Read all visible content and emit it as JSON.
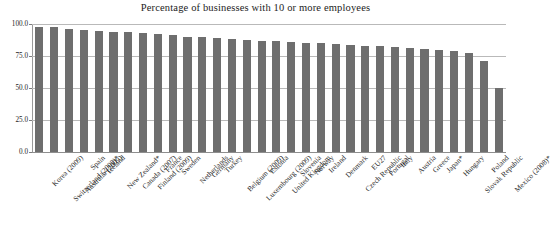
{
  "chart_data": {
    "type": "bar",
    "title": "Percentage of businesses with 10 or more employees",
    "xlabel": "",
    "ylabel": "",
    "ylim": [
      0.0,
      100.0
    ],
    "yticks": [
      "0.0",
      "25.0",
      "50.0",
      "75.0",
      "100.0"
    ],
    "ytick_values": [
      0.0,
      25.0,
      50.0,
      75.0,
      100.0
    ],
    "grid": true,
    "legend": false,
    "legend_position": "none",
    "bar_color": "#6e6e6e",
    "categories": [
      "Korea (2009)",
      "Switzerland (2008)*",
      "Australia (2009)",
      "Spain",
      "Iceland",
      "New Zealand*",
      "Canada (2007)",
      "Finland (2009)",
      "France",
      "Sweden",
      "Netherlands",
      "Germany",
      "Turkey",
      "Belgium (2009)",
      "Luxembourg (2009)",
      "Estonia",
      "United Kingdom",
      "Slovenia",
      "Norway",
      "Ireland",
      "Denmark",
      "Czech Republic",
      "EU27",
      "Portugal",
      "Italy",
      "Austria",
      "Greece",
      "Japan*",
      "Hungary",
      "Slovak Republic",
      "Poland",
      "Mexico (2008)*"
    ],
    "values": [
      98.0,
      97.5,
      96.0,
      95.0,
      94.5,
      94.0,
      93.5,
      93.0,
      92.0,
      91.5,
      90.0,
      89.5,
      89.0,
      88.0,
      87.5,
      87.0,
      86.5,
      86.0,
      85.5,
      85.0,
      84.0,
      83.5,
      83.0,
      82.5,
      82.0,
      81.0,
      80.5,
      80.0,
      79.0,
      77.0,
      71.0,
      50.0
    ]
  }
}
